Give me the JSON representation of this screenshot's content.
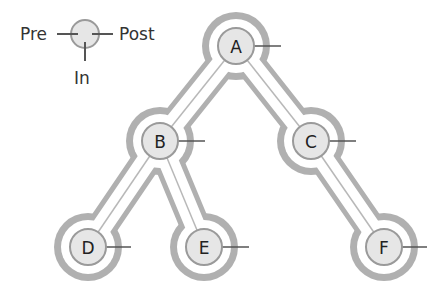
{
  "legend": {
    "pre": "Pre",
    "post": "Post",
    "in": "In"
  },
  "tree": {
    "nodes": [
      {
        "id": "A",
        "label": "A",
        "x": 236,
        "y": 46
      },
      {
        "id": "B",
        "label": "B",
        "x": 160,
        "y": 141
      },
      {
        "id": "C",
        "label": "C",
        "x": 311,
        "y": 141
      },
      {
        "id": "D",
        "label": "D",
        "x": 88,
        "y": 247
      },
      {
        "id": "E",
        "label": "E",
        "x": 204,
        "y": 247
      },
      {
        "id": "F",
        "label": "F",
        "x": 384,
        "y": 247
      }
    ],
    "edges": [
      [
        "A",
        "B"
      ],
      [
        "A",
        "C"
      ],
      [
        "B",
        "D"
      ],
      [
        "B",
        "E"
      ],
      [
        "C",
        "F"
      ]
    ]
  },
  "colors": {
    "outline": "#b0b0b0",
    "node_fill": "#e6e6e6",
    "node_border": "#9a9a9a",
    "tick": "#555555"
  }
}
